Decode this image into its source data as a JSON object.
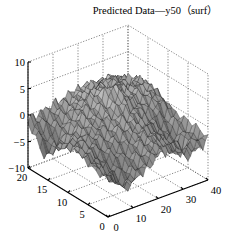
{
  "chart_data": {
    "type": "surface",
    "title": "Predicted Data—y50（surf）",
    "xlabel": "",
    "ylabel": "",
    "zlabel": "",
    "xlim": [
      0,
      40
    ],
    "ylim": [
      0,
      20
    ],
    "zlim": [
      -10,
      10
    ],
    "x_ticks": [
      "0",
      "10",
      "20",
      "30",
      "40"
    ],
    "y_ticks": [
      "0",
      "5",
      "10",
      "15",
      "20"
    ],
    "z_ticks": [
      "−10",
      "−5",
      "0",
      "5",
      "10"
    ],
    "grid": true,
    "colormap": "gray",
    "x_grid": [
      0,
      4,
      8,
      12,
      16,
      20,
      24,
      28,
      32,
      36,
      40
    ],
    "y_grid": [
      0,
      2,
      4,
      6,
      8,
      10,
      12,
      14,
      16,
      18,
      20
    ],
    "z_values": [
      [
        -3.0,
        -4.0,
        -5.5,
        -4.5,
        -3.5,
        -2.0,
        -1.5,
        -3.0,
        -4.0,
        -3.5,
        -2.5
      ],
      [
        -2.5,
        -3.5,
        -6.5,
        -5.0,
        -3.0,
        -1.5,
        -1.0,
        -2.5,
        -3.5,
        -3.0,
        -2.0
      ],
      [
        -2.0,
        -3.0,
        -5.0,
        -4.0,
        -2.5,
        -1.0,
        -0.5,
        -2.0,
        -3.0,
        -4.5,
        -1.5
      ],
      [
        -1.5,
        -2.5,
        -3.5,
        -2.5,
        -1.5,
        -0.5,
        0.0,
        -1.0,
        -3.0,
        -4.0,
        -1.0
      ],
      [
        -1.0,
        -1.5,
        -2.0,
        -1.5,
        -0.5,
        0.5,
        0.5,
        -0.5,
        -2.0,
        -2.5,
        -0.5
      ],
      [
        -1.5,
        -1.0,
        -1.0,
        -0.5,
        0.0,
        1.0,
        2.0,
        1.0,
        0.0,
        0.5,
        0.0
      ],
      [
        -2.5,
        -2.0,
        -1.0,
        0.0,
        0.5,
        1.5,
        4.5,
        2.0,
        1.0,
        1.5,
        0.5
      ],
      [
        -4.0,
        -3.0,
        -1.5,
        0.5,
        1.0,
        2.5,
        6.0,
        3.0,
        2.0,
        2.5,
        1.0
      ],
      [
        -6.0,
        -4.5,
        -2.0,
        0.5,
        1.5,
        3.0,
        4.0,
        3.5,
        3.0,
        2.0,
        1.0
      ],
      [
        -3.0,
        -2.0,
        -1.0,
        0.0,
        1.0,
        2.0,
        2.5,
        2.0,
        1.5,
        1.0,
        0.5
      ],
      [
        -1.0,
        -0.5,
        0.0,
        0.5,
        1.0,
        1.5,
        1.5,
        1.0,
        0.5,
        0.5,
        0.0
      ]
    ]
  }
}
